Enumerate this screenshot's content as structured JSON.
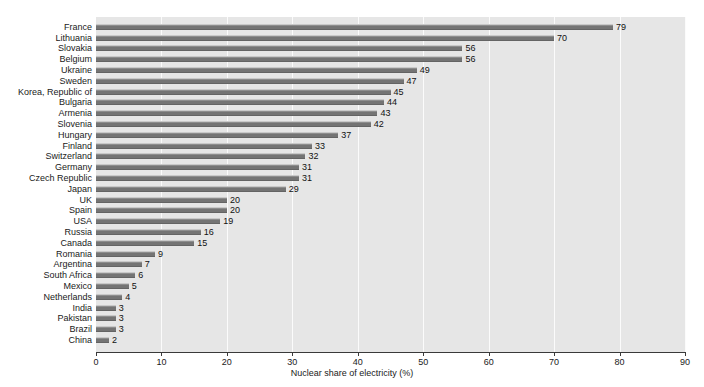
{
  "chart_data": {
    "type": "bar",
    "orientation": "horizontal",
    "title": "",
    "xlabel": "Nuclear share of electricity (%)",
    "ylabel": "",
    "xlim": [
      0,
      90
    ],
    "xticks": [
      "0",
      "10",
      "20",
      "30",
      "40",
      "50",
      "60",
      "70",
      "80",
      "90"
    ],
    "grid": "vertical-white",
    "legend": "none",
    "categories": [
      "France",
      "Lithuania",
      "Slovakia",
      "Belgium",
      "Ukraine",
      "Sweden",
      "Korea, Republic of",
      "Bulgaria",
      "Armenia",
      "Slovenia",
      "Hungary",
      "Finland",
      "Switzerland",
      "Germany",
      "Czech Republic",
      "Japan",
      "UK",
      "Spain",
      "USA",
      "Russia",
      "Canada",
      "Romania",
      "Argentina",
      "South Africa",
      "Mexico",
      "Netherlands",
      "India",
      "Pakistan",
      "Brazil",
      "China"
    ],
    "values": [
      79,
      70,
      56,
      56,
      49,
      47,
      45,
      44,
      43,
      42,
      37,
      33,
      32,
      31,
      31,
      29,
      20,
      20,
      19,
      16,
      15,
      9,
      7,
      6,
      5,
      4,
      3,
      3,
      3,
      2
    ],
    "value_labels": [
      "79",
      "70",
      "56",
      "56",
      "49",
      "47",
      "45",
      "44",
      "43",
      "42",
      "37",
      "33",
      "32",
      "31",
      "31",
      "29",
      "20",
      "20",
      "19",
      "16",
      "15",
      "9",
      "7",
      "6",
      "5",
      "4",
      "3",
      "3",
      "3",
      "2"
    ],
    "colors": {
      "bar": "#7d7d7d",
      "bar_highlight": "#c9c9c9",
      "plot_background": "#e6e6e6",
      "gridline": "#fbfbfb",
      "axis": "#3a3a3a",
      "text": "#1a1a1a",
      "page_background": "#ffffff"
    }
  }
}
